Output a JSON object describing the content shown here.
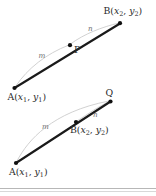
{
  "figure": {
    "colors": {
      "segment": "#1a1a1a",
      "arc": "#c9c9c9",
      "point": "#101010",
      "label": "#2a2a2a",
      "ratio_label": "#6e6e6e",
      "divider": "#b7b7b7",
      "background": "#ffffff"
    },
    "top_diagram": {
      "name": "internal-division",
      "points": [
        {
          "id": "A",
          "label": "A(",
          "sub1": "1",
          "mid": ", ",
          "sub2": "1",
          "close": ")",
          "var1": "x",
          "var2": "y",
          "x": 14,
          "y": 88
        },
        {
          "id": "P",
          "label": "P",
          "x": 70,
          "y": 45
        },
        {
          "id": "B",
          "label": "B(",
          "sub1": "2",
          "mid": ", ",
          "sub2": "2",
          "close": ")",
          "var1": "x",
          "var2": "y",
          "x": 120,
          "y": 23
        }
      ],
      "labels": {
        "A": "A(x₁, y₁)",
        "P": "P",
        "B": "B(x₂, y₂)",
        "ratio_m": "m",
        "ratio_n": "n"
      }
    },
    "bottom_diagram": {
      "name": "external-division",
      "points": [
        {
          "id": "A",
          "x": 16,
          "y": 163
        },
        {
          "id": "B",
          "x": 76,
          "y": 122
        },
        {
          "id": "Q",
          "x": 110,
          "y": 101
        }
      ],
      "labels": {
        "A": "A(x₁, y₁)",
        "B": "B(x₂, y₂)",
        "Q": "Q",
        "ratio_m": "m",
        "ratio_n": "n"
      }
    }
  }
}
